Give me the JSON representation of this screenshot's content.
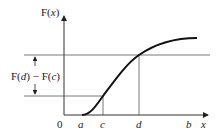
{
  "diagram": {
    "y_axis_label": "F(x)",
    "x_axis_label": "x",
    "origin_label": "0",
    "x_ticks": [
      "a",
      "c",
      "d",
      "b"
    ],
    "difference_label": "F(d) − F(c)",
    "colors": {
      "curve": "#111111",
      "axes": "#333333",
      "guides": "#555555"
    }
  }
}
